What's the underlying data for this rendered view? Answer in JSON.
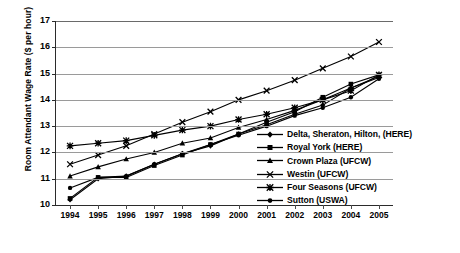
{
  "chart_data": {
    "type": "line",
    "title": "",
    "xlabel": "",
    "ylabel": "Room Attendant Wage Rate ($ per hour)",
    "x": [
      1994,
      1995,
      1996,
      1997,
      1998,
      1999,
      2000,
      2001,
      2002,
      2003,
      2004,
      2005
    ],
    "categories": [
      "1994",
      "1995",
      "1996",
      "1997",
      "1998",
      "1999",
      "2000",
      "2001",
      "2002",
      "2003",
      "2004",
      "2005"
    ],
    "ylim": [
      10,
      17
    ],
    "yticks": [
      10,
      11,
      12,
      13,
      14,
      15,
      16,
      17
    ],
    "ytick_labels": [
      "10",
      "11",
      "12",
      "13",
      "14",
      "15",
      "16",
      "17"
    ],
    "grid": "horizontal",
    "legend_position": "inside-right",
    "series": [
      {
        "name": "Delta, Sheraton, Hilton, (HERE)",
        "marker": "diamond",
        "values": [
          10.2,
          11.0,
          11.1,
          11.55,
          11.95,
          12.25,
          12.7,
          13.05,
          13.45,
          13.8,
          14.45,
          14.85
        ]
      },
      {
        "name": "Royal York (HERE)",
        "marker": "square",
        "values": [
          10.25,
          11.05,
          11.05,
          11.5,
          11.9,
          12.3,
          12.7,
          13.15,
          13.55,
          14.1,
          14.6,
          14.95
        ]
      },
      {
        "name": "Crown Plaza (UFCW)",
        "marker": "triangle",
        "values": [
          11.1,
          11.45,
          11.75,
          12.0,
          12.35,
          12.55,
          12.95,
          13.25,
          13.6,
          14.0,
          14.45,
          14.9
        ]
      },
      {
        "name": "Westin (UFCW)",
        "marker": "x",
        "values": [
          11.55,
          11.9,
          12.25,
          12.7,
          13.15,
          13.55,
          14.0,
          14.35,
          14.75,
          15.2,
          15.65,
          16.2
        ]
      },
      {
        "name": "Four Seasons (UFCW)",
        "marker": "star",
        "values": [
          12.25,
          12.35,
          12.45,
          12.65,
          12.85,
          13.0,
          13.25,
          13.45,
          13.7,
          14.0,
          14.35,
          14.95
        ]
      },
      {
        "name": "Sutton (USWA)",
        "marker": "circle",
        "values": [
          10.65,
          11.05,
          11.1,
          11.55,
          11.95,
          12.3,
          12.65,
          13.0,
          13.4,
          13.7,
          14.1,
          14.8
        ]
      }
    ]
  },
  "legend": {
    "items": [
      {
        "label": "Delta, Sheraton, Hilton, (HERE)"
      },
      {
        "label": "Royal York (HERE)"
      },
      {
        "label": "Crown Plaza (UFCW)"
      },
      {
        "label": "Westin (UFCW)"
      },
      {
        "label": "Four Seasons (UFCW)"
      },
      {
        "label": "Sutton (USWA)"
      }
    ]
  },
  "colors": {
    "series": "#000000",
    "grid": "#9a9a9a",
    "axis": "#2b2b2b",
    "background": "#ffffff"
  }
}
